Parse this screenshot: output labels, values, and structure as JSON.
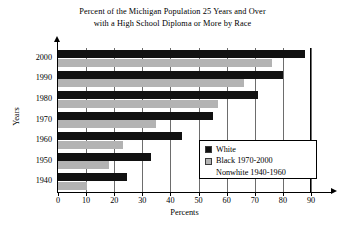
{
  "chart_data": {
    "type": "bar",
    "orientation": "horizontal",
    "title": "Percent of the Michigan Population 25 Years and Over with a High School Diploma or More by Race",
    "title_lines": [
      "Percent of the Michigan Population 25 Years and Over",
      "with a High School Diploma or More by Race"
    ],
    "xlabel": "Percents",
    "ylabel": "Years",
    "categories": [
      "2000",
      "1990",
      "1980",
      "1970",
      "1960",
      "1950",
      "1940"
    ],
    "xlim": [
      0,
      90
    ],
    "xticks": [
      0,
      10,
      20,
      30,
      40,
      50,
      60,
      70,
      80,
      90
    ],
    "xtick_labels": [
      "0",
      "10",
      "20",
      "30",
      "40",
      "50",
      "60",
      "70",
      "80",
      "90"
    ],
    "grid": true,
    "grid_axis": "x",
    "legend_position": "center-right-inside",
    "series": [
      {
        "name": "White",
        "color": "#111111",
        "values": [
          88.0,
          80.0,
          71.0,
          55.0,
          44.0,
          33.0,
          24.5
        ]
      },
      {
        "name": "Black 1970-2000 / Nonwhite 1940-1960",
        "color": "#b3b3b3",
        "values": [
          76.0,
          66.0,
          57.0,
          35.0,
          23.0,
          18.0,
          10.3
        ]
      }
    ],
    "legend_entries": [
      {
        "label": "White",
        "swatch": "white-series"
      },
      {
        "label": "Black 1970-2000",
        "swatch": "black-series"
      },
      {
        "label": "Nonwhite 1940-1960",
        "swatch": "none"
      }
    ]
  }
}
